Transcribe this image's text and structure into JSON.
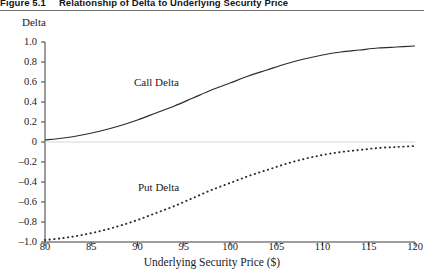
{
  "figure": {
    "number": "Figure 5.1",
    "caption": "Relationship of Delta to Underlying Security Price"
  },
  "chart_data": {
    "type": "line",
    "title": "Relationship of Delta to Underlying Security Price",
    "xlabel": "Underlying Security Price ($)",
    "ylabel": "Delta",
    "xlim": [
      80,
      120
    ],
    "ylim": [
      -1.0,
      1.0
    ],
    "xticks": [
      80,
      85,
      90,
      95,
      100,
      105,
      110,
      115,
      120
    ],
    "xtick_labels": [
      "80",
      "85",
      "90",
      "95",
      "100",
      "105",
      "110",
      "115",
      "120"
    ],
    "yticks": [
      1.0,
      0.8,
      0.6,
      0.4,
      0.2,
      0,
      -0.2,
      -0.4,
      -0.6,
      -0.8,
      -1.0
    ],
    "ytick_labels": [
      "1.0",
      "0.8",
      "0.6",
      "0.4",
      "0.2",
      "0",
      "–0.2",
      "–0.4",
      "–0.6",
      "–0.8",
      "–1.0"
    ],
    "grid": false,
    "legend": "inline-annotations",
    "zero_line": true,
    "zero_line_color": "#d8d8d8",
    "axis_color": "#3c3c3c",
    "x": [
      80,
      82,
      84,
      86,
      88,
      90,
      92,
      94,
      96,
      98,
      100,
      102,
      104,
      106,
      108,
      110,
      112,
      114,
      116,
      118,
      120
    ],
    "series": [
      {
        "name": "Call Delta",
        "style": "solid",
        "color": "#2b2b2b",
        "annotation": "Call Delta",
        "values": [
          0.02,
          0.04,
          0.07,
          0.11,
          0.16,
          0.22,
          0.29,
          0.36,
          0.44,
          0.52,
          0.59,
          0.66,
          0.72,
          0.78,
          0.83,
          0.87,
          0.9,
          0.92,
          0.94,
          0.95,
          0.96
        ]
      },
      {
        "name": "Put Delta",
        "style": "dotted",
        "color": "#2b2b2b",
        "annotation": "Put Delta",
        "values": [
          -0.98,
          -0.96,
          -0.93,
          -0.89,
          -0.84,
          -0.78,
          -0.71,
          -0.64,
          -0.56,
          -0.48,
          -0.41,
          -0.34,
          -0.28,
          -0.22,
          -0.17,
          -0.13,
          -0.1,
          -0.08,
          -0.06,
          -0.05,
          -0.04
        ]
      }
    ]
  }
}
